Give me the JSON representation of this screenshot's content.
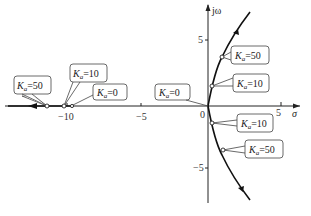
{
  "diagram": {
    "axes": {
      "x_label": "σ",
      "y_label": "jω",
      "x_ticks": [
        "−10",
        "−5",
        "0",
        "5"
      ],
      "y_ticks": [
        "5",
        "−5"
      ]
    },
    "labels": [
      {
        "id": "k50-real",
        "text": "=50",
        "sub": "a"
      },
      {
        "id": "k10-real",
        "text": "=10",
        "sub": "a"
      },
      {
        "id": "k0-real",
        "text": "=0",
        "sub": "a"
      },
      {
        "id": "k0-origin",
        "text": "=0",
        "sub": "a"
      },
      {
        "id": "k50-upper",
        "text": "=50",
        "sub": "a"
      },
      {
        "id": "k10-upper",
        "text": "=10",
        "sub": "a"
      },
      {
        "id": "k10-lower",
        "text": "=10",
        "sub": "a"
      },
      {
        "id": "k50-lower",
        "text": "=50",
        "sub": "a"
      }
    ],
    "gain_symbol": "K"
  }
}
